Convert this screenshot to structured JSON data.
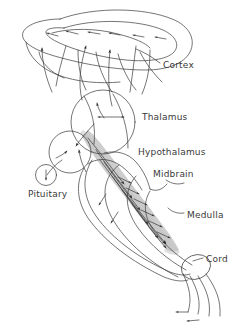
{
  "figure": {
    "kind": "neuroanatomy-schematic",
    "title": "",
    "background_color": "#ffffff",
    "stroke_color": "#3a3a3a",
    "shade_color": "#c9c9c9",
    "width": 240,
    "height": 332
  },
  "labels": [
    {
      "id": "cortex",
      "text": "Cortex",
      "x": 163,
      "y": 68
    },
    {
      "id": "thalamus",
      "text": "Thalamus",
      "x": 142,
      "y": 120
    },
    {
      "id": "hypothalamus",
      "text": "Hypothalamus",
      "x": 138,
      "y": 155
    },
    {
      "id": "midbrain",
      "text": "Midbrain",
      "x": 153,
      "y": 177
    },
    {
      "id": "medulla",
      "text": "Medulla",
      "x": 187,
      "y": 218
    },
    {
      "id": "cord",
      "text": "Cord",
      "x": 206,
      "y": 262
    },
    {
      "id": "pituitary",
      "text": "Pituitary",
      "x": 28,
      "y": 197
    }
  ],
  "structures": [
    {
      "id": "cortex-outline",
      "name": "Cortex",
      "shape": "banana-lobe",
      "shaded": false
    },
    {
      "id": "thalamus-circle",
      "name": "Thalamus",
      "shape": "circle",
      "shaded": false
    },
    {
      "id": "hypothalamus-circle",
      "name": "Hypothalamus",
      "shape": "circle",
      "shaded": false
    },
    {
      "id": "pituitary-circle",
      "name": "Pituitary",
      "shape": "small-circle",
      "shaded": false
    },
    {
      "id": "midbrain-region",
      "name": "Midbrain",
      "shape": "lobe",
      "shaded": false
    },
    {
      "id": "medulla-region",
      "name": "Medulla",
      "shape": "tapered-tube",
      "shaded": false
    },
    {
      "id": "cord-ellipse",
      "name": "Cord",
      "shape": "ellipse",
      "shaded": false
    },
    {
      "id": "reticular-core",
      "name": "Reticular formation",
      "shape": "shaded-band",
      "shaded": true
    }
  ],
  "pathways": {
    "description": "Arrowed fibre tracts",
    "counts": {
      "cortex_surface_arrows": 6,
      "ascending_to_cortex_arrows": 3,
      "thalamus_internal_double_arrow": 1,
      "brainstem_core_arrows": 14,
      "cord_outflow_arrows": 2,
      "pituitary_arrow": 1
    }
  }
}
